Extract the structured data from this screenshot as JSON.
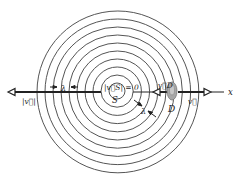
{
  "figure": {
    "colors": {
      "ink": "#333333",
      "circle": "#555555",
      "ear": "#9a9a9a",
      "background": "#ffffff"
    },
    "source": {
      "label": "S",
      "velocity_label": "|v⃗S| = 0",
      "cx": 117,
      "cy": 91
    },
    "detector": {
      "label": "D",
      "velocity_label": "v⃗D",
      "icon": "ear-icon"
    },
    "axis": {
      "label": "x"
    },
    "left_velocity_label": "|v⃗|",
    "right_velocity_label": "v⃗",
    "wavelength_label_left": "λ",
    "wavelength_label_right": "λ",
    "wavefronts": {
      "count": 10,
      "spacing": 8.1,
      "inner_radius": 8
    }
  }
}
